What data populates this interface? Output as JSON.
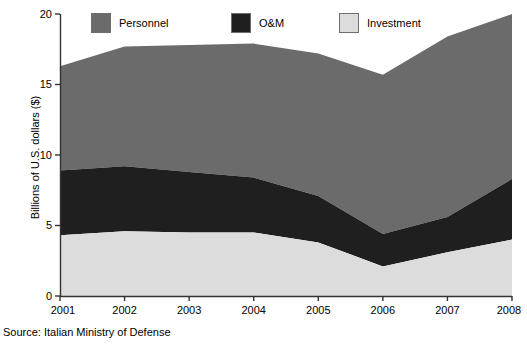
{
  "chart_data": {
    "type": "area",
    "stacked": true,
    "title": "",
    "subtitle": "",
    "xlabel": "",
    "ylabel": "Billions of U.S. dollars ($)",
    "categories": [
      "2001",
      "2002",
      "2003",
      "2004",
      "2005",
      "2006",
      "2007",
      "2008"
    ],
    "x": [
      2001,
      2002,
      2003,
      2004,
      2005,
      2006,
      2007,
      2008
    ],
    "xlim": [
      2001,
      2008
    ],
    "ylim": [
      0,
      20
    ],
    "y_ticks": [
      0,
      5,
      10,
      15,
      20
    ],
    "grid": false,
    "legend_position": "top",
    "stack_order_bottom_to_top": [
      "Investment",
      "O&M",
      "Personnel"
    ],
    "series": [
      {
        "name": "Investment",
        "color": "#dcdcdc",
        "values": [
          4.3,
          4.6,
          4.5,
          4.5,
          3.8,
          2.1,
          3.1,
          4.0
        ]
      },
      {
        "name": "O&M",
        "color": "#1f1f1f",
        "values": [
          4.6,
          4.6,
          4.3,
          3.9,
          3.3,
          2.3,
          2.5,
          4.3
        ]
      },
      {
        "name": "Personnel",
        "color": "#6b6b6b",
        "values": [
          7.4,
          8.5,
          9.0,
          9.5,
          10.1,
          11.3,
          12.8,
          11.7
        ]
      }
    ],
    "cumulative_top_of_band": {
      "Investment": [
        4.3,
        4.6,
        4.5,
        4.5,
        3.8,
        2.1,
        3.1,
        4.0
      ],
      "O&M": [
        8.9,
        9.2,
        8.8,
        8.4,
        7.1,
        4.4,
        5.6,
        8.3
      ],
      "Personnel": [
        16.3,
        17.7,
        17.8,
        17.9,
        17.2,
        15.7,
        18.4,
        20.0
      ]
    },
    "annotations": []
  },
  "legend": {
    "items": [
      {
        "label": "Personnel",
        "color": "#6b6b6b"
      },
      {
        "label": "O&M",
        "color": "#1f1f1f"
      },
      {
        "label": "Investment",
        "color": "#dcdcdc"
      }
    ]
  },
  "axes": {
    "y_title": "Billions of U.S. dollars ($)",
    "y_tick_labels": [
      "20",
      "15",
      "10",
      "5",
      "0"
    ],
    "x_tick_labels": [
      "2001",
      "2002",
      "2003",
      "2004",
      "2005",
      "2006",
      "2007",
      "2008"
    ]
  },
  "footer": {
    "source": "Source: Italian Ministry of Defense"
  }
}
